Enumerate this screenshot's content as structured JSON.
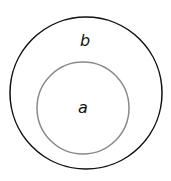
{
  "diagram": {
    "type": "nested-circles",
    "outer": {
      "label": "b",
      "stroke": "#111111",
      "cx": 86,
      "cy": 93,
      "r": 76,
      "stroke_width": 1.5,
      "label_x": 85,
      "label_y": 46
    },
    "inner": {
      "label": "a",
      "stroke": "#8a8a8a",
      "cx": 83,
      "cy": 108,
      "r": 46,
      "stroke_width": 1.5,
      "label_x": 83,
      "label_y": 113
    }
  }
}
